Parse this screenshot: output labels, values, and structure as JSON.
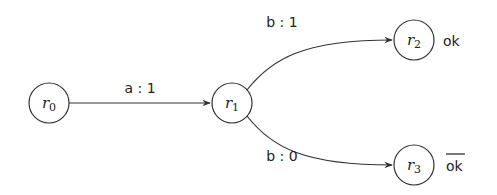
{
  "diagram": {
    "states": [
      {
        "id": "r0",
        "base": "r",
        "sub": "0",
        "cx": 49,
        "cy": 103,
        "r": 20
      },
      {
        "id": "r1",
        "base": "r",
        "sub": "1",
        "cx": 232,
        "cy": 103,
        "r": 20
      },
      {
        "id": "r2",
        "base": "r",
        "sub": "2",
        "cx": 414,
        "cy": 40,
        "r": 20,
        "output": "ok",
        "output_negated": false
      },
      {
        "id": "r3",
        "base": "r",
        "sub": "3",
        "cx": 414,
        "cy": 165,
        "r": 20,
        "output": "ok",
        "output_negated": true
      }
    ],
    "transitions": [
      {
        "from": "r0",
        "to": "r1",
        "label": "a : 1"
      },
      {
        "from": "r1",
        "to": "r2",
        "label": "b : 1"
      },
      {
        "from": "r1",
        "to": "r3",
        "label": "b : 0"
      }
    ]
  }
}
